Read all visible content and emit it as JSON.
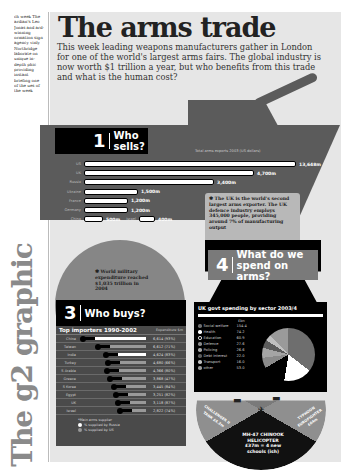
{
  "sidebar": {
    "blurb": "ch week The ardian's Leo Jonas and ard-winning ormation sign agency vinly Northridge laborate on unique in-depth phic providing instant briefing one of the ues of the week",
    "graphic_label": "The g2 graphic"
  },
  "header": {
    "title": "The arms trade",
    "intro": "This week leading weapons manufacturers gather in London for one of the world's largest arms fairs. The global industry is now worth $1 trillion a year, but who benefits from this trade and what is the human cost?"
  },
  "section1": {
    "num": "1",
    "label": "Who sells?",
    "note": "Total arms exports 2003 (US dollars)",
    "uk_note": "The UK is the world's second largest arms exporter. The UK defence industry employs 345,000 people, providing around 7% of manufacturing output"
  },
  "section2": {
    "note": "World military expenditure reached $1,035 trillion in 2004"
  },
  "section3": {
    "num": "3",
    "label": "Who buys?",
    "table_title": "Top importers 1990-2002",
    "col_header": "Expenditure $m",
    "legend_title": "*Main arms supplier",
    "legend": [
      {
        "label": "% supplied by Russia",
        "color": "#ffffff"
      },
      {
        "label": "% supplied by US",
        "color": "#999999"
      }
    ]
  },
  "section4": {
    "num": "4",
    "label": "What do we spend on arms?",
    "spend_title": "UK govt spending by sector 2003/4",
    "col_header": "£bn",
    "wheel": {
      "center": "MH-47 CHINOOK HELICOPTER £37m = 4 new schools (ish)",
      "left": "CHALLENGER II TANK £4.2m",
      "right": "TYPHOON EUROFIGHTER £64m"
    }
  },
  "chart_data": [
    {
      "type": "bar",
      "title": "Who sells?",
      "subtitle": "Total arms exports 2003 (US dollars)",
      "categories": [
        "US",
        "UK",
        "Russia",
        "Ukraine",
        "France",
        "Germany",
        "China",
        "Israel"
      ],
      "values": [
        13648,
        4700,
        3400,
        1500,
        1200,
        1200,
        500,
        400
      ],
      "labels": [
        "13,648m",
        "4,700m",
        "3,400m",
        "1,500m",
        "1,200m",
        "1,200m",
        "500m",
        "400m"
      ],
      "xlabel": "",
      "ylabel": "US$ m"
    },
    {
      "type": "table",
      "title": "Top importers 1990-2002",
      "columns": [
        "Country",
        "Expenditure $m (% from main supplier)"
      ],
      "categories": [
        "China",
        "Taiwan",
        "India",
        "Turkey",
        "S Arabia",
        "Greece",
        "S Korea",
        "Egypt",
        "UK",
        "Israel"
      ],
      "values": [
        6614,
        6612,
        4624,
        4680,
        4366,
        3868,
        3445,
        3251,
        3118,
        2822
      ],
      "labels": [
        "6,614 (93%)",
        "6,612 (71%)",
        "4,624 (83%)",
        "4,680 (66%)",
        "4,366 (80%)",
        "3,868 (47%)",
        "3,445 (84%)",
        "3,251 (82%)",
        "3,118 (87%)",
        "2,822 (74%)"
      ],
      "bar_pct": [
        93,
        71,
        83,
        66,
        80,
        47,
        84,
        82,
        87,
        74
      ],
      "main_supplier": [
        "Russia",
        "US",
        "Russia",
        "US",
        "US",
        "US",
        "US",
        "US",
        "US",
        "US"
      ]
    },
    {
      "type": "pie",
      "title": "UK govt spending by sector 2003/4",
      "unit": "£bn",
      "categories": [
        "Social welfare",
        "Health",
        "Education",
        "Defence",
        "Policing",
        "Debt interest",
        "Transport",
        "other"
      ],
      "values": [
        154.4,
        74.2,
        60.9,
        27.6,
        26.6,
        22.0,
        16.0,
        53.0
      ],
      "colors": [
        "#6e6e6e",
        "#ffffff",
        "#000000",
        "#8a8a8a",
        "#a5a5a5",
        "#5c5c5c",
        "#c0c0c0",
        "#9a9a9a"
      ]
    }
  ],
  "sellers": [
    {
      "country": "US",
      "label": "13,648m",
      "w": 210
    },
    {
      "country": "UK",
      "label": "4,700m",
      "w": 168
    },
    {
      "country": "Russia",
      "label": "3,400m",
      "w": 128
    },
    {
      "country": "Ukraine",
      "label": "1,500m",
      "w": 52
    },
    {
      "country": "France",
      "label": "1,200m",
      "w": 42
    },
    {
      "country": "Germany",
      "label": "1,200m",
      "w": 42
    },
    {
      "country": "China",
      "label": "500m",
      "w": 17
    }
  ],
  "seller_israel": {
    "country": "Israel",
    "label": "400m"
  }
}
